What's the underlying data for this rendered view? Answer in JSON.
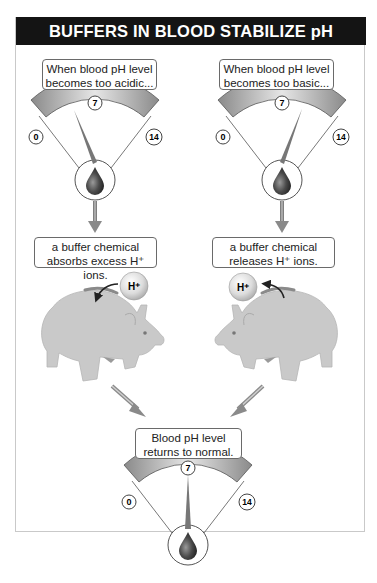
{
  "title": "BUFFERS IN BLOOD STABILIZE pH",
  "left_column": {
    "condition_lines": [
      "When blood pH level",
      "becomes too acidic..."
    ],
    "gauge": {
      "min_label": "0",
      "mid_label": "7",
      "max_label": "14",
      "needle_state": "acidic (tilted toward 0)"
    },
    "action_lines": [
      "a buffer chemical",
      "absorbs excess H⁺ ions."
    ],
    "ion_label": "H⁺"
  },
  "right_column": {
    "condition_lines": [
      "When blood pH level",
      "becomes too basic..."
    ],
    "gauge": {
      "min_label": "0",
      "mid_label": "7",
      "max_label": "14",
      "needle_state": "basic (tilted toward 14)"
    },
    "action_lines": [
      "a buffer chemical",
      "releases H⁺ ions."
    ],
    "ion_label": "H⁺"
  },
  "result": {
    "lines": [
      "Blood pH level",
      "returns to normal."
    ],
    "gauge": {
      "min_label": "0",
      "mid_label": "7",
      "max_label": "14",
      "needle_state": "neutral (pointing at 7)"
    }
  },
  "colors": {
    "header_bg": "#141414",
    "gauge_band": "#9a9a9a",
    "piggy": "#c8c8c8",
    "blood_drop": "#3a3a3a"
  }
}
